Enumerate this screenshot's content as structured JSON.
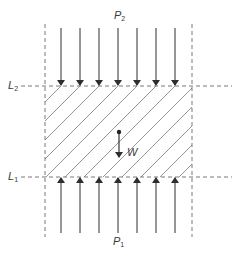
{
  "diagram": {
    "labels": {
      "p_top": {
        "main": "P",
        "sub": "2"
      },
      "p_bottom": {
        "main": "P",
        "sub": "1"
      },
      "l_top": {
        "main": "L",
        "sub": "2"
      },
      "l_bottom": {
        "main": "L",
        "sub": "1"
      },
      "weight": "W"
    },
    "arrows_top_count": 7,
    "arrows_bottom_count": 7,
    "arrow_x_positions": [
      61,
      80,
      99,
      118,
      137,
      156,
      175
    ],
    "colors": {
      "line": "#3a3a3a",
      "dashed": "#6a6a6a",
      "hatch": "#8a8a8a",
      "background": "#ffffff"
    }
  }
}
